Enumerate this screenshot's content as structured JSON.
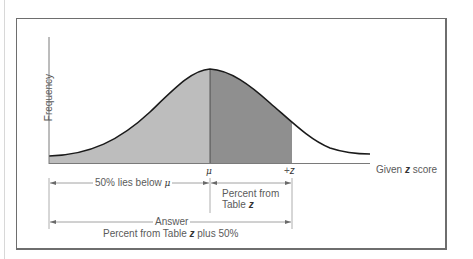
{
  "diagram": {
    "y_axis_label": "Frequency",
    "x_axis_label_prefix": "Given ",
    "x_axis_label_var": "z",
    "x_axis_label_suffix": " score",
    "mu_tick_label": "μ",
    "z_tick_label_sign": "+",
    "z_tick_label_var": "z",
    "left_bracket_label_text": "50% lies below ",
    "left_bracket_label_symbol": "μ",
    "right_bracket_label_line1": "Percent from",
    "right_bracket_label_line2_text": "Table ",
    "right_bracket_label_line2_var": "z",
    "answer_label": "Answer",
    "answer_sub_text": "Percent from Table ",
    "answer_sub_var": "z",
    "answer_sub_suffix": " plus 50%",
    "colors": {
      "below_mean_fill": "#bdbdbd",
      "mean_to_z_fill": "#8f8f8f",
      "curve_stroke": "#1a1a1a",
      "axis_stroke": "#7a7a7a",
      "frame_stroke": "#6e6e6e",
      "text": "#5a5a5a"
    }
  }
}
